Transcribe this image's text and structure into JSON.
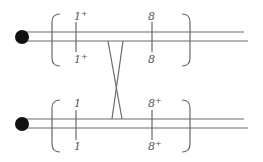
{
  "diagram": {
    "type": "feynman-ladder",
    "colors": {
      "line": "#6a6a6a",
      "dot": "#111111",
      "text": "#555555",
      "background": "#ffffff"
    },
    "top_track": {
      "left_vertex_top_label": "1",
      "left_vertex_top_sup": "+",
      "left_vertex_bottom_label": "1",
      "left_vertex_bottom_sup": "+",
      "right_vertex_top_label": "8",
      "right_vertex_top_sup": "",
      "right_vertex_bottom_label": "8",
      "right_vertex_bottom_sup": ""
    },
    "bottom_track": {
      "left_vertex_top_label": "1",
      "left_vertex_top_sup": "",
      "left_vertex_bottom_label": "1",
      "left_vertex_bottom_sup": "",
      "right_vertex_top_label": "8",
      "right_vertex_top_sup": "+",
      "right_vertex_bottom_label": "8",
      "right_vertex_bottom_sup": "+"
    }
  }
}
